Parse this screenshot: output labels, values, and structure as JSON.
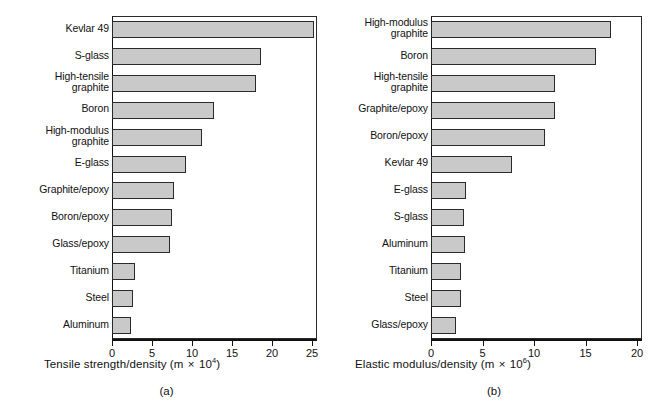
{
  "figure": {
    "background": "#ffffff",
    "bar_fill": "#c9c9c9",
    "bar_stroke": "#2a2a2a"
  },
  "panels": [
    {
      "caption": "(a)",
      "axis_title_main": "Tensile strength/density (m",
      "axis_title_times": "×",
      "axis_title_base": "10",
      "axis_title_exp": "4",
      "axis_title_close": ")",
      "ticks": [
        "0",
        "5",
        "10",
        "15",
        "20",
        "25"
      ]
    },
    {
      "caption": "(b)",
      "axis_title_main": "Elastic modulus/density (m",
      "axis_title_times": "×",
      "axis_title_base": "10",
      "axis_title_exp": "6",
      "axis_title_close": ")",
      "ticks": [
        "0",
        "5",
        "10",
        "15",
        "20"
      ]
    }
  ],
  "chart_data": [
    {
      "type": "bar",
      "orientation": "horizontal",
      "title": "",
      "panel_label": "(a)",
      "xlabel": "Tensile strength/density (m × 10^4)",
      "ylabel": "",
      "xlim": [
        0,
        25.6
      ],
      "xticks": [
        0,
        5,
        10,
        15,
        20,
        25
      ],
      "grid": false,
      "legend": "none",
      "categories": [
        "Kevlar 49",
        "S-glass",
        "High-tensile\ngraphite",
        "Boron",
        "High-modulus\ngraphite",
        "E-glass",
        "Graphite/epoxy",
        "Boron/epoxy",
        "Glass/epoxy",
        "Titanium",
        "Steel",
        "Aluminum"
      ],
      "values": [
        25.2,
        18.6,
        18.0,
        12.8,
        11.3,
        9.3,
        7.7,
        7.5,
        7.2,
        2.9,
        2.6,
        2.4
      ]
    },
    {
      "type": "bar",
      "orientation": "horizontal",
      "title": "",
      "panel_label": "(b)",
      "xlabel": "Elastic modulus/density (m × 10^6)",
      "ylabel": "",
      "xlim": [
        0,
        20.5
      ],
      "xticks": [
        0,
        5,
        10,
        15,
        20
      ],
      "grid": false,
      "legend": "none",
      "categories": [
        "High-modulus\ngraphite",
        "Boron",
        "High-tensile\ngraphite",
        "Graphite/epoxy",
        "Boron/epoxy",
        "Kevlar 49",
        "E-glass",
        "S-glass",
        "Aluminum",
        "Titanium",
        "Steel",
        "Glass/epoxy"
      ],
      "values": [
        17.5,
        16.0,
        12.0,
        12.0,
        11.1,
        7.9,
        3.4,
        3.2,
        3.3,
        2.9,
        2.9,
        2.4
      ]
    }
  ]
}
